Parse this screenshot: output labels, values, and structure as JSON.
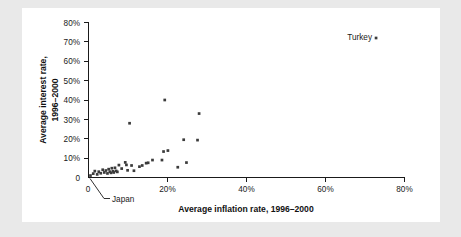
{
  "figure": {
    "background_color": "#e9e9e9",
    "card_color": "#ffffff",
    "point_color": "#3b3b3b",
    "axis_color": "#1a1a1a"
  },
  "chart_data": {
    "type": "scatter",
    "title": "",
    "xlabel": "Average inflation rate, 1996–2000",
    "ylabel": "Average interest rate, 1996–2000",
    "xlim": [
      0,
      80
    ],
    "ylim": [
      0,
      80
    ],
    "grid": false,
    "legend": "none",
    "xticks": [
      0,
      20,
      40,
      60,
      80
    ],
    "xticklabels": [
      "0",
      "20%",
      "40%",
      "60%",
      "80%"
    ],
    "yticks": [
      0,
      10,
      20,
      30,
      40,
      50,
      60,
      70,
      80
    ],
    "yticklabels": [
      "0",
      "10%",
      "20%",
      "30%",
      "40%",
      "50%",
      "60%",
      "70%",
      "80%"
    ],
    "series": [
      {
        "name": "Countries",
        "points": [
          [
            0.5,
            1.0
          ],
          [
            1.2,
            2.0
          ],
          [
            1.6,
            3.3
          ],
          [
            2.2,
            1.6
          ],
          [
            2.6,
            3.0
          ],
          [
            3.1,
            2.2
          ],
          [
            3.6,
            4.0
          ],
          [
            4.0,
            2.6
          ],
          [
            4.4,
            3.6
          ],
          [
            4.8,
            2.1
          ],
          [
            5.1,
            4.3
          ],
          [
            5.4,
            3.0
          ],
          [
            5.7,
            2.4
          ],
          [
            5.9,
            4.8
          ],
          [
            6.2,
            3.2
          ],
          [
            6.4,
            2.6
          ],
          [
            6.7,
            5.0
          ],
          [
            7.0,
            3.4
          ],
          [
            7.3,
            2.9
          ],
          [
            7.7,
            6.4
          ],
          [
            8.4,
            4.6
          ],
          [
            9.3,
            7.8
          ],
          [
            9.6,
            6.5
          ],
          [
            9.9,
            3.7
          ],
          [
            10.4,
            28.0
          ],
          [
            10.9,
            6.2
          ],
          [
            11.5,
            3.5
          ],
          [
            12.9,
            5.6
          ],
          [
            13.6,
            6.2
          ],
          [
            14.6,
            7.4
          ],
          [
            15.1,
            7.6
          ],
          [
            16.2,
            9.0
          ],
          [
            18.6,
            9.0
          ],
          [
            19.0,
            13.4
          ],
          [
            19.3,
            40.0
          ],
          [
            20.1,
            13.9
          ],
          [
            22.6,
            5.3
          ],
          [
            24.1,
            19.5
          ],
          [
            24.8,
            7.7
          ],
          [
            27.6,
            19.3
          ],
          [
            28.0,
            33.0
          ],
          [
            72.8,
            72.0
          ]
        ]
      }
    ],
    "annotations": [
      {
        "label": "Turkey",
        "target_x": 72.8,
        "target_y": 72.0,
        "position": "left-of-point"
      },
      {
        "label": "Japan",
        "target_x": 0.5,
        "target_y": 1.0,
        "position": "below-with-leader-line"
      }
    ]
  }
}
